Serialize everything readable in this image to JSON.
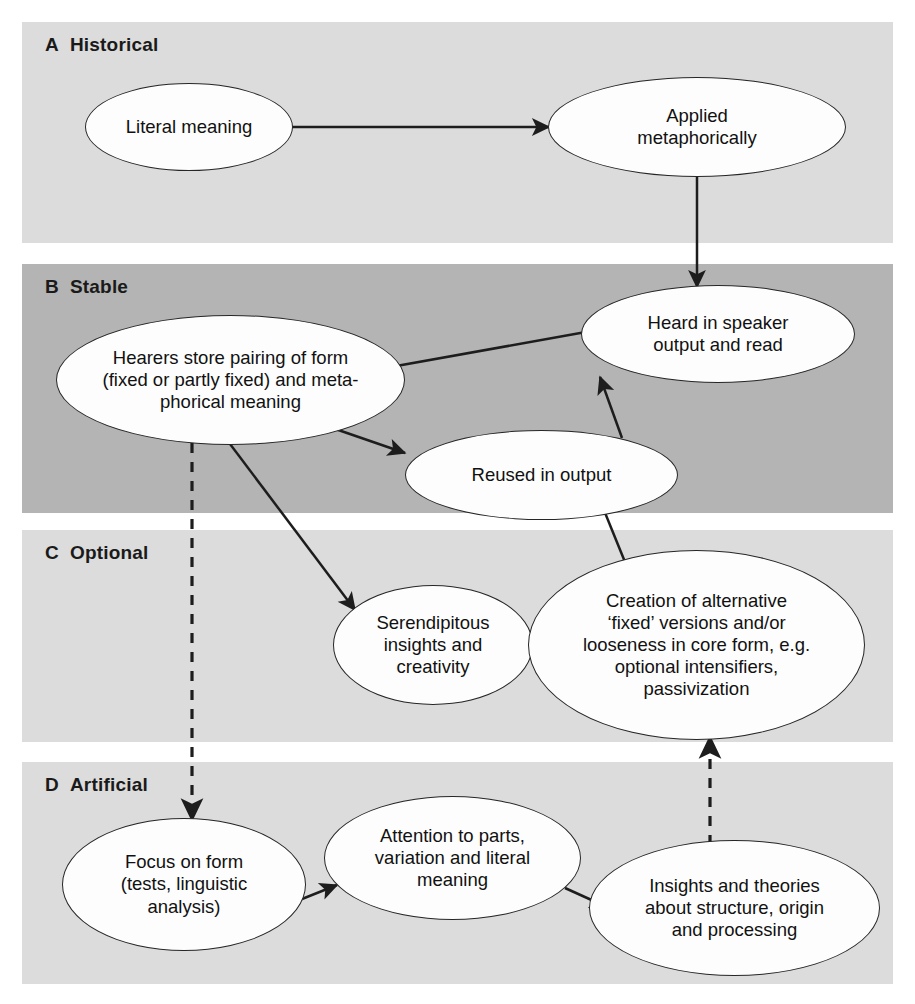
{
  "figure": {
    "background": "#ffffff",
    "panel_fill_light": "#dcdcdc",
    "panel_fill_dark": "#b4b4b4",
    "node_fill": "#fdfdfd",
    "stroke": "#262626"
  },
  "panels": [
    {
      "letter": "A",
      "title": "Historical",
      "fill": "#dcdcdc"
    },
    {
      "letter": "B",
      "title": "Stable",
      "fill": "#b4b4b4"
    },
    {
      "letter": "C",
      "title": "Optional",
      "fill": "#dcdcdc"
    },
    {
      "letter": "D",
      "title": "Artificial",
      "fill": "#dcdcdc"
    }
  ],
  "nodes": [
    {
      "id": "literal-meaning",
      "panel": "A",
      "label": "Literal meaning"
    },
    {
      "id": "applied-metaphorically",
      "panel": "A",
      "label": "Applied\nmetaphorically"
    },
    {
      "id": "heard-in-speaker-output",
      "panel": "B",
      "label": "Heard in speaker\noutput and read"
    },
    {
      "id": "hearers-store-pairing",
      "panel": "B",
      "label": "Hearers store pairing of form\n(fixed or partly fixed) and meta-\nphorical meaning"
    },
    {
      "id": "reused-in-output",
      "panel": "B",
      "label": "Reused in output"
    },
    {
      "id": "serendipitous-insights",
      "panel": "C",
      "label": "Serendipitous\ninsights and\ncreativity"
    },
    {
      "id": "creation-of-alternative",
      "panel": "C",
      "label": "Creation of alternative\n‘fixed’ versions and/or\nlooseness in core form, e.g.\noptional intensifiers,\npassivization"
    },
    {
      "id": "focus-on-form",
      "panel": "D",
      "label": "Focus on form\n(tests, linguistic\nanalysis)"
    },
    {
      "id": "attention-to-parts",
      "panel": "D",
      "label": "Attention to parts,\nvariation and literal\nmeaning"
    },
    {
      "id": "insights-and-theories",
      "panel": "D",
      "label": "Insights and theories\nabout structure, origin\nand processing"
    }
  ],
  "edges": [
    {
      "from": "literal-meaning",
      "to": "applied-metaphorically",
      "style": "solid"
    },
    {
      "from": "applied-metaphorically",
      "to": "heard-in-speaker-output",
      "style": "solid"
    },
    {
      "from": "heard-in-speaker-output",
      "to": "hearers-store-pairing",
      "style": "solid"
    },
    {
      "from": "hearers-store-pairing",
      "to": "reused-in-output",
      "style": "solid"
    },
    {
      "from": "reused-in-output",
      "to": "heard-in-speaker-output",
      "style": "solid"
    },
    {
      "from": "hearers-store-pairing",
      "to": "serendipitous-insights",
      "style": "solid"
    },
    {
      "from": "serendipitous-insights",
      "to": "creation-of-alternative",
      "style": "solid"
    },
    {
      "from": "creation-of-alternative",
      "to": "reused-in-output",
      "style": "solid"
    },
    {
      "from": "hearers-store-pairing",
      "to": "focus-on-form",
      "style": "dashed"
    },
    {
      "from": "focus-on-form",
      "to": "attention-to-parts",
      "style": "solid"
    },
    {
      "from": "attention-to-parts",
      "to": "insights-and-theories",
      "style": "solid"
    },
    {
      "from": "insights-and-theories",
      "to": "creation-of-alternative",
      "style": "dashed"
    }
  ]
}
